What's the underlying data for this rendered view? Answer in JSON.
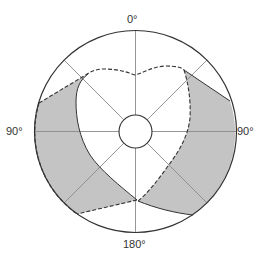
{
  "diagram": {
    "type": "polar-field-diagram",
    "labels": {
      "top": "0°",
      "left": "90°",
      "right": "90°",
      "bottom": "180°"
    },
    "colors": {
      "background": "#ffffff",
      "outline": "#333333",
      "grid": "#8a8a8a",
      "shaded": "#c4c4c4"
    },
    "geometry": {
      "center": [
        135.5,
        131.5
      ],
      "outer_radius": 101,
      "inner_radius": 16.5,
      "radial_line_angles_deg": [
        0,
        45,
        90,
        135,
        180,
        225,
        270,
        315
      ]
    },
    "regions": [
      {
        "name": "left-shaded-region",
        "fill": "shaded"
      },
      {
        "name": "right-shaded-region",
        "fill": "shaded"
      }
    ],
    "boundaries": [
      {
        "name": "outer-dashed-boundary",
        "style": "dashed"
      },
      {
        "name": "inner-solid-boundary",
        "style": "solid"
      }
    ]
  }
}
